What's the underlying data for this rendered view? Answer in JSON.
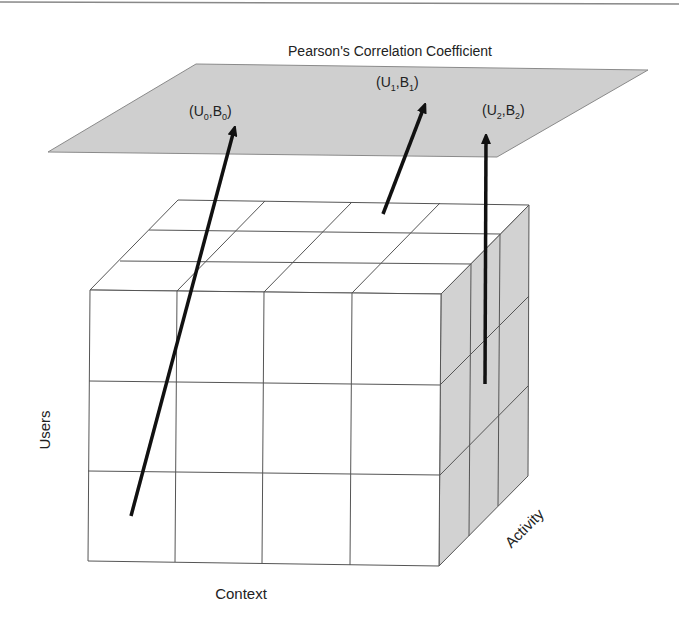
{
  "title": "Pearson's Correlation Coefficient",
  "plane": {
    "label": "Pearson's Correlation Coefficient",
    "fill": "#d0d0d0",
    "points": [
      {
        "label_main": "(U",
        "sub_u": "0",
        "label_mid": ",B",
        "sub_b": "0",
        "label_end": ")"
      },
      {
        "label_main": "(U",
        "sub_u": "1",
        "label_mid": ",B",
        "sub_b": "1",
        "label_end": ")"
      },
      {
        "label_main": "(U",
        "sub_u": "2",
        "label_mid": ",B",
        "sub_b": "2",
        "label_end": ")"
      }
    ]
  },
  "cube": {
    "axes": {
      "users": "Users",
      "context": "Context",
      "activity": "Activity"
    },
    "front_fill": "#ffffff",
    "side_fill": "#d4d4d4",
    "grid": {
      "context_cells": 4,
      "users_cells": 3,
      "activity_cells": 3
    }
  },
  "arrows": [
    {
      "from": "cube-cell-front",
      "to": "(U0,B0)"
    },
    {
      "from": "cube-top",
      "to": "(U1,B1)"
    },
    {
      "from": "cube-side",
      "to": "(U2,B2)"
    }
  ]
}
